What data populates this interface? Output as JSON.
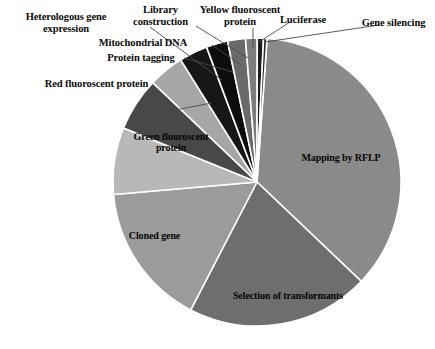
{
  "chart_data": {
    "type": "pie",
    "title": "",
    "subtitle": "",
    "xlabel": "",
    "ylabel": "",
    "legend_position": "none",
    "grid": false,
    "label_style": "callout-leader-lines",
    "geometry": {
      "center_x": 257,
      "center_y": 182,
      "radius": 144,
      "start_angle_deg": -86,
      "direction": "clockwise",
      "slice_gap_color": "#ffffff"
    },
    "categories": [
      "Mapping by RFLP",
      "Selection of transformants",
      "Cloned gene",
      "Green fluoroscent protein",
      "Red fluoroscent protein",
      "Heterologous gene expression",
      "Protein tagging",
      "Mitochondrial DNA",
      "Library construction",
      "Yellow fluoroscent protein",
      "Luciferase",
      "Gene silencing"
    ],
    "values": [
      36.0,
      20.5,
      16.0,
      7.5,
      6.0,
      4.0,
      3.2,
      2.4,
      2.0,
      1.3,
      0.7,
      0.4
    ],
    "slices": [
      {
        "label": "Mapping by RFLP",
        "value": 36.0,
        "start_deg": -86.0,
        "end_deg": 43.6,
        "color": "#8a8a8a",
        "label_placement": "inside",
        "label_x": 338,
        "label_y": 158
      },
      {
        "label": "Selection of transformants",
        "value": 20.5,
        "start_deg": 43.6,
        "end_deg": 117.4,
        "color": "#6e6e6e",
        "label_placement": "inside",
        "label_x": 286,
        "label_y": 296
      },
      {
        "label": "Cloned gene",
        "value": 16.0,
        "start_deg": 117.4,
        "end_deg": 175.0,
        "color": "#9b9b9b",
        "label_placement": "inside",
        "label_x": 155,
        "label_y": 236
      },
      {
        "label": "Green fluoroscent protein",
        "value": 7.5,
        "start_deg": 175.0,
        "end_deg": 202.0,
        "color": "#b8b8b8",
        "label_placement": "inside",
        "label_x": 170,
        "label_y": 152
      },
      {
        "label": "Red fluoroscent protein",
        "value": 6.0,
        "start_deg": 202.0,
        "end_deg": 223.6,
        "color": "#484848",
        "label_placement": "outside",
        "label_x": 100,
        "label_y": 82,
        "leader": [
          [
            175,
            110
          ],
          [
            212,
            103
          ]
        ]
      },
      {
        "label": "Heterologous gene expression",
        "value": 4.0,
        "start_deg": 223.6,
        "end_deg": 238.0,
        "color": "#a6a6a6",
        "label_placement": "outside",
        "label_x": 66,
        "label_y": 18,
        "leader": [
          [
            150,
            27
          ],
          [
            222,
            80
          ]
        ]
      },
      {
        "label": "Protein tagging",
        "value": 3.2,
        "start_deg": 238.0,
        "end_deg": 249.5,
        "color": "#161616",
        "label_placement": "outside",
        "label_x": 140,
        "label_y": 54,
        "leader": [
          [
            184,
            58
          ],
          [
            233,
            72
          ]
        ]
      },
      {
        "label": "Mitochondrial DNA",
        "value": 2.4,
        "start_deg": 249.5,
        "end_deg": 258.2,
        "color": "#0d0d0d",
        "label_placement": "outside",
        "label_x": 150,
        "label_y": 40,
        "leader": [
          [
            212,
            45
          ],
          [
            241,
            65
          ]
        ]
      },
      {
        "label": "Library construction",
        "value": 2.0,
        "start_deg": 258.2,
        "end_deg": 265.4,
        "color": "#6a6a6a",
        "label_placement": "outside",
        "label_x": 160,
        "label_y": 5,
        "leader": [
          [
            196,
            26
          ],
          [
            248,
            58
          ]
        ]
      },
      {
        "label": "Yellow fluoroscent protein",
        "value": 1.3,
        "start_deg": 265.4,
        "end_deg": 270.1,
        "color": "#7d7d7d",
        "label_placement": "outside",
        "label_x": 234,
        "label_y": 5,
        "leader": [
          [
            253,
            28
          ],
          [
            253,
            48
          ]
        ]
      },
      {
        "label": "Luciferase",
        "value": 0.7,
        "start_deg": 270.1,
        "end_deg": 272.6,
        "color": "#1c1c1c",
        "label_placement": "outside",
        "label_x": 300,
        "label_y": 15,
        "leader": [
          [
            290,
            22
          ],
          [
            259,
            42
          ]
        ]
      },
      {
        "label": "Gene silencing",
        "value": 0.4,
        "start_deg": 272.6,
        "end_deg": 274.0,
        "color": "#2a2a2a",
        "label_placement": "outside",
        "label_x": 390,
        "label_y": 19,
        "leader": [
          [
            379,
            25
          ],
          [
            265,
            42
          ]
        ]
      }
    ]
  },
  "labels": {
    "heterologous_gene_expression": "Heterologous gene\nexpression",
    "library_construction": "Library\nconstruction",
    "yellow_fluoroscent_protein": "Yellow fluoroscent\nprotein",
    "luciferase": "Luciferase",
    "gene_silencing": "Gene silencing",
    "mitochondrial_dna": "Mitochondrial DNA",
    "protein_tagging": "Protein tagging",
    "red_fluoroscent_protein": "Red fluoroscent protein",
    "green_fluoroscent_protein": "Green fluoroscent\nprotein",
    "cloned_gene": "Cloned gene",
    "mapping_by_rflp": "Mapping by RFLP",
    "selection_of_transformants": "Selection of transformants"
  }
}
